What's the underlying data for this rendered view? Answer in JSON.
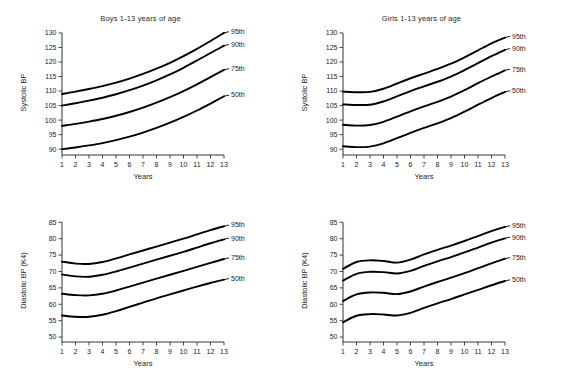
{
  "figure": {
    "background_color": "#ffffff",
    "line_color": "#000000",
    "width": 562,
    "height": 374
  },
  "chart_data": [
    {
      "id": "boys-systolic",
      "type": "line",
      "title": "Boys 1-13 years of age",
      "xlabel": "Years",
      "ylabel": "Systolic BP",
      "xlim": [
        1,
        13
      ],
      "ylim": [
        88,
        131
      ],
      "grid": false,
      "legend_position": "right-inline",
      "xticks": [
        1,
        2,
        3,
        4,
        5,
        6,
        7,
        8,
        9,
        10,
        11,
        12,
        13
      ],
      "yticks": [
        90,
        95,
        100,
        105,
        110,
        115,
        120,
        125,
        130
      ],
      "x": [
        1,
        2,
        3,
        4,
        5,
        6,
        7,
        8,
        9,
        10,
        11,
        12,
        13
      ],
      "series": [
        {
          "name": "95th",
          "values": [
            109.0,
            109.8,
            110.7,
            111.7,
            112.9,
            114.3,
            115.9,
            117.7,
            119.7,
            122.0,
            124.5,
            127.2,
            130.0
          ]
        },
        {
          "name": "90th",
          "values": [
            105.0,
            105.8,
            106.7,
            107.7,
            108.9,
            110.3,
            111.9,
            113.7,
            115.7,
            118.0,
            120.5,
            123.1,
            125.6
          ]
        },
        {
          "name": "75th",
          "values": [
            98.0,
            98.7,
            99.5,
            100.4,
            101.5,
            102.8,
            104.3,
            106.0,
            107.9,
            110.0,
            112.3,
            114.8,
            117.3
          ]
        },
        {
          "name": "50th",
          "values": [
            90.0,
            90.6,
            91.3,
            92.1,
            93.1,
            94.3,
            95.7,
            97.3,
            99.1,
            101.1,
            103.3,
            105.7,
            108.2
          ]
        }
      ]
    },
    {
      "id": "girls-systolic",
      "type": "line",
      "title": "Girls 1-13 years of age",
      "xlabel": "Years",
      "ylabel": "Systolic BP",
      "xlim": [
        1,
        13
      ],
      "ylim": [
        88,
        131
      ],
      "grid": false,
      "legend_position": "right-inline",
      "xticks": [
        1,
        2,
        3,
        4,
        5,
        6,
        7,
        8,
        9,
        10,
        11,
        12,
        13
      ],
      "yticks": [
        90,
        95,
        100,
        105,
        110,
        115,
        120,
        125,
        130
      ],
      "x": [
        1,
        2,
        3,
        4,
        5,
        6,
        7,
        8,
        9,
        10,
        11,
        12,
        13
      ],
      "series": [
        {
          "name": "95th",
          "values": [
            109.8,
            109.6,
            109.7,
            110.8,
            112.6,
            114.4,
            116.0,
            117.6,
            119.4,
            121.6,
            124.0,
            126.4,
            128.4
          ]
        },
        {
          "name": "90th",
          "values": [
            105.4,
            105.2,
            105.3,
            106.4,
            108.2,
            110.0,
            111.6,
            113.2,
            115.0,
            117.2,
            119.6,
            122.0,
            124.2
          ]
        },
        {
          "name": "75th",
          "values": [
            98.4,
            98.1,
            98.3,
            99.4,
            101.2,
            103.0,
            104.7,
            106.3,
            108.1,
            110.3,
            112.7,
            115.0,
            117.1
          ]
        },
        {
          "name": "50th",
          "values": [
            91.0,
            90.7,
            90.9,
            92.0,
            93.8,
            95.6,
            97.3,
            98.9,
            100.7,
            102.9,
            105.3,
            107.6,
            109.7
          ]
        }
      ]
    },
    {
      "id": "boys-diastolic",
      "type": "line",
      "title": "",
      "xlabel": "Years",
      "ylabel": "Diastolic BP (K4)",
      "xlim": [
        1,
        13
      ],
      "ylim": [
        48.5,
        86
      ],
      "grid": false,
      "legend_position": "right-inline",
      "xticks": [
        1,
        2,
        3,
        4,
        5,
        6,
        7,
        8,
        9,
        10,
        11,
        12,
        13
      ],
      "yticks": [
        50,
        55,
        60,
        65,
        70,
        75,
        80,
        85
      ],
      "x": [
        1,
        2,
        3,
        4,
        5,
        6,
        7,
        8,
        9,
        10,
        11,
        12,
        13
      ],
      "series": [
        {
          "name": "95th",
          "values": [
            73.0,
            72.4,
            72.3,
            72.9,
            74.0,
            75.2,
            76.4,
            77.6,
            78.8,
            80.0,
            81.3,
            82.6,
            83.8
          ]
        },
        {
          "name": "90th",
          "values": [
            69.1,
            68.5,
            68.4,
            69.0,
            70.0,
            71.2,
            72.4,
            73.6,
            74.8,
            76.0,
            77.3,
            78.6,
            79.8
          ]
        },
        {
          "name": "75th",
          "values": [
            63.2,
            62.8,
            62.7,
            63.2,
            64.2,
            65.4,
            66.6,
            67.8,
            69.0,
            70.2,
            71.4,
            72.6,
            73.8
          ]
        },
        {
          "name": "50th",
          "values": [
            56.6,
            56.2,
            56.2,
            56.8,
            57.9,
            59.2,
            60.5,
            61.8,
            63.0,
            64.2,
            65.4,
            66.5,
            67.5
          ]
        }
      ]
    },
    {
      "id": "girls-diastolic",
      "type": "line",
      "title": "",
      "xlabel": "Years",
      "ylabel": "Diastolic BP (K4)",
      "xlim": [
        1,
        13
      ],
      "ylim": [
        48.5,
        86
      ],
      "grid": false,
      "legend_position": "right-inline",
      "xticks": [
        1,
        2,
        3,
        4,
        5,
        6,
        7,
        8,
        9,
        10,
        11,
        12,
        13
      ],
      "yticks": [
        50,
        55,
        60,
        65,
        70,
        75,
        80,
        85
      ],
      "x": [
        1,
        2,
        3,
        4,
        5,
        6,
        7,
        8,
        9,
        10,
        11,
        12,
        13
      ],
      "series": [
        {
          "name": "95th",
          "values": [
            70.8,
            72.9,
            73.4,
            73.2,
            72.7,
            73.6,
            75.2,
            76.6,
            77.9,
            79.3,
            80.8,
            82.3,
            83.6
          ]
        },
        {
          "name": "90th",
          "values": [
            67.2,
            69.3,
            69.9,
            69.8,
            69.4,
            70.2,
            71.7,
            73.1,
            74.4,
            75.8,
            77.3,
            78.8,
            80.1
          ]
        },
        {
          "name": "75th",
          "values": [
            61.0,
            63.0,
            63.6,
            63.5,
            63.1,
            63.9,
            65.4,
            66.8,
            68.1,
            69.5,
            71.0,
            72.5,
            73.9
          ]
        },
        {
          "name": "50th",
          "values": [
            54.5,
            56.5,
            57.0,
            56.9,
            56.6,
            57.4,
            58.9,
            60.3,
            61.6,
            63.0,
            64.4,
            65.8,
            67.1
          ]
        }
      ]
    }
  ]
}
